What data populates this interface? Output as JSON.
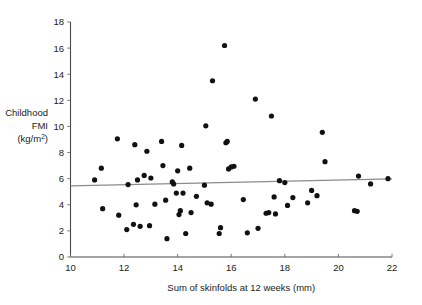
{
  "chart_data": {
    "type": "scatter",
    "title": "",
    "xlabel": "Sum of skinfolds at 12 weeks (mm)",
    "ylabel_lines": [
      "Childhood",
      "FMI",
      "(kg/m"
    ],
    "ylabel_sup": "2",
    "ylabel_tail": ")",
    "xlim": [
      10,
      22
    ],
    "ylim": [
      0,
      18
    ],
    "xticks": [
      10,
      12,
      14,
      16,
      18,
      20,
      22
    ],
    "xtick_labels": [
      "10",
      "12",
      "14",
      "16",
      "18",
      "20",
      "22"
    ],
    "yticks": [
      0,
      2,
      4,
      6,
      8,
      10,
      12,
      14,
      16,
      18
    ],
    "ytick_labels": [
      "0",
      "2",
      "4",
      "6",
      "8",
      "10",
      "12",
      "14",
      "16",
      "18"
    ],
    "grid": false,
    "legend": "none",
    "marker": "filled-circle",
    "marker_color": "#111111",
    "point_radius": 2.6,
    "trendline": {
      "name": "regression-line",
      "color": "#8c8c8c",
      "x0": 10.0,
      "y0": 5.45,
      "x1": 22.0,
      "y1": 5.98
    },
    "points": [
      [
        10.9,
        5.9
      ],
      [
        11.15,
        6.8
      ],
      [
        11.2,
        3.7
      ],
      [
        11.75,
        9.05
      ],
      [
        11.8,
        3.2
      ],
      [
        12.1,
        2.1
      ],
      [
        12.15,
        5.55
      ],
      [
        12.35,
        2.5
      ],
      [
        12.4,
        8.6
      ],
      [
        12.45,
        4.0
      ],
      [
        12.5,
        5.9
      ],
      [
        12.6,
        2.35
      ],
      [
        12.75,
        6.25
      ],
      [
        12.85,
        8.1
      ],
      [
        12.95,
        2.4
      ],
      [
        13.0,
        6.05
      ],
      [
        13.15,
        4.05
      ],
      [
        13.4,
        8.85
      ],
      [
        13.45,
        7.0
      ],
      [
        13.55,
        4.35
      ],
      [
        13.6,
        1.4
      ],
      [
        13.8,
        5.75
      ],
      [
        13.85,
        5.6
      ],
      [
        13.95,
        4.9
      ],
      [
        14.0,
        6.6
      ],
      [
        14.05,
        3.25
      ],
      [
        14.1,
        3.55
      ],
      [
        14.15,
        8.55
      ],
      [
        14.2,
        4.9
      ],
      [
        14.3,
        1.8
      ],
      [
        14.45,
        6.8
      ],
      [
        14.5,
        3.4
      ],
      [
        14.7,
        4.65
      ],
      [
        15.0,
        5.5
      ],
      [
        15.05,
        10.05
      ],
      [
        15.1,
        4.15
      ],
      [
        15.25,
        4.05
      ],
      [
        15.3,
        13.5
      ],
      [
        15.55,
        1.8
      ],
      [
        15.6,
        2.25
      ],
      [
        15.75,
        16.2
      ],
      [
        15.8,
        8.75
      ],
      [
        15.85,
        8.85
      ],
      [
        15.9,
        6.75
      ],
      [
        16.0,
        6.9
      ],
      [
        16.1,
        6.95
      ],
      [
        16.45,
        4.4
      ],
      [
        16.6,
        1.85
      ],
      [
        16.9,
        12.1
      ],
      [
        17.0,
        2.2
      ],
      [
        17.3,
        3.35
      ],
      [
        17.4,
        3.4
      ],
      [
        17.5,
        10.8
      ],
      [
        17.6,
        4.6
      ],
      [
        17.65,
        3.3
      ],
      [
        17.8,
        5.85
      ],
      [
        18.0,
        5.7
      ],
      [
        18.1,
        3.95
      ],
      [
        18.3,
        4.55
      ],
      [
        18.85,
        4.15
      ],
      [
        19.0,
        5.1
      ],
      [
        19.2,
        4.7
      ],
      [
        19.4,
        9.55
      ],
      [
        19.5,
        7.3
      ],
      [
        20.6,
        3.55
      ],
      [
        20.7,
        3.5
      ],
      [
        20.75,
        6.2
      ],
      [
        21.2,
        5.6
      ],
      [
        21.85,
        6.0
      ]
    ]
  }
}
